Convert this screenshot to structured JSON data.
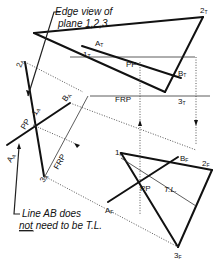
{
  "figure": {
    "notes": {
      "edge_view_line1": "Edge view of",
      "edge_view_line2": "plane 1,2,3",
      "line_ab_line1": "Line AB does",
      "line_ab_line2_underlined": "not",
      "line_ab_line2_rest": "need to be T.L."
    },
    "top_view": {
      "points": {
        "p1": "1",
        "p1_sub": "T",
        "p2": "2",
        "p2_sub": "T",
        "p3": "3",
        "p3_sub": "T",
        "a": "A",
        "a_sub": "T",
        "b": "B",
        "b_sub": "T"
      },
      "pp_label": "PP",
      "frp_label": "FRP"
    },
    "front_view": {
      "points": {
        "p1": "1",
        "p1_sub": "F",
        "p2": "2",
        "p2_sub": "F",
        "p3": "3",
        "p3_sub": "F",
        "a": "A",
        "a_sub": "F",
        "b": "B",
        "b_sub": "F"
      },
      "pp_label": "PP",
      "tl_label": "T.L."
    },
    "aux_view": {
      "points": {
        "p2": "2",
        "p2_sub": "A",
        "p3": "3",
        "p3_sub": "A",
        "a": "A",
        "a_sub": "A",
        "b": "B",
        "b_sub": "A",
        "p1": "1",
        "p1_sub": "A"
      },
      "pp_label": "PP",
      "frp_label": "FRP"
    }
  }
}
